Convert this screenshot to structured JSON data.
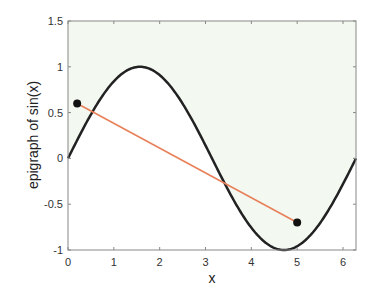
{
  "chart_data": {
    "type": "line",
    "title": "",
    "xlabel": "x",
    "ylabel": "epigraph of sin(x)",
    "xlim": [
      0,
      6.2832
    ],
    "ylim": [
      -1,
      1.5
    ],
    "grid": false,
    "x_ticks": [
      0,
      1,
      2,
      3,
      4,
      5,
      6
    ],
    "x_tick_labels": [
      "0",
      "1",
      "2",
      "3",
      "4",
      "5",
      "6"
    ],
    "y_ticks": [
      -1,
      -0.5,
      0,
      0.5,
      1,
      1.5
    ],
    "y_tick_labels": [
      "-1",
      "-0.5",
      "0",
      "0.5",
      "1",
      "1.5"
    ],
    "series": [
      {
        "name": "sin(x)",
        "function": "sin(x)",
        "x_range": [
          0,
          6.2832
        ],
        "color": "#222222",
        "line_width": 2.5
      },
      {
        "name": "chord",
        "type": "line_segment",
        "x": [
          0.2,
          5.0
        ],
        "y": [
          0.6,
          -0.7
        ],
        "color": "#e8805a",
        "line_width": 1.6,
        "markers": true,
        "marker_color": "#111111"
      }
    ],
    "shaded_region": {
      "name": "epigraph",
      "description": "region above sin(x)",
      "color": "#f3f8f1"
    },
    "legend": null
  }
}
